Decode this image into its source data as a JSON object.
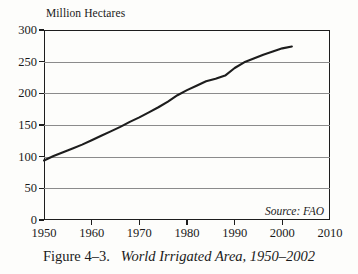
{
  "figure": {
    "caption_number": "Figure 4–3.",
    "caption_title": "World Irrigated Area, 1950–2002",
    "source_note": "Source: FAO",
    "background_color": "#fdfdfb",
    "line_color": "#1d1d1d",
    "grid_color": "#8b8b8b",
    "frame_color": "#1d1d1d"
  },
  "chart_data": {
    "type": "line",
    "title": "World Irrigated Area, 1950–2002",
    "subtitle": "",
    "xlabel": "",
    "ylabel": "Million Hectares",
    "y_axis_unit_label": "Million Hectares",
    "xlim": [
      1950,
      2010
    ],
    "ylim": [
      0,
      300
    ],
    "xticks": [
      1950,
      1960,
      1970,
      1980,
      1990,
      2000,
      2010
    ],
    "xtick_labels": [
      "1950",
      "1960",
      "1970",
      "1980",
      "1990",
      "2000",
      "2010"
    ],
    "yticks": [
      0,
      50,
      100,
      150,
      200,
      250,
      300
    ],
    "ytick_labels": [
      "0",
      "50",
      "100",
      "150",
      "200",
      "250",
      "300"
    ],
    "grid": "horizontal",
    "legend": "none",
    "annotations": [
      "Source: FAO"
    ],
    "series": [
      {
        "name": "World Irrigated Area",
        "units": "million hectares",
        "x": [
          1950,
          1952,
          1954,
          1956,
          1958,
          1960,
          1962,
          1964,
          1966,
          1968,
          1970,
          1972,
          1974,
          1976,
          1978,
          1980,
          1982,
          1984,
          1986,
          1988,
          1990,
          1992,
          1994,
          1996,
          1998,
          2000,
          2002
        ],
        "values": [
          94,
          101,
          107,
          113,
          119,
          126,
          133,
          140,
          147,
          155,
          162,
          170,
          178,
          187,
          197,
          205,
          212,
          219,
          223,
          228,
          240,
          249,
          255,
          261,
          266,
          271,
          274
        ]
      }
    ]
  }
}
